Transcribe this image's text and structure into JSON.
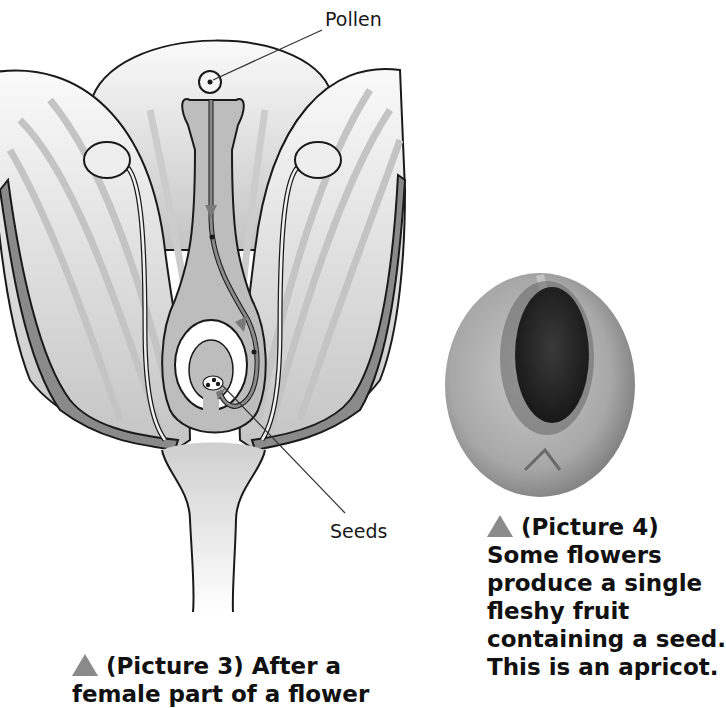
{
  "figure_left": {
    "id_label": "Picture 3",
    "labels": {
      "pollen": "Pollen",
      "seeds": "Seeds"
    },
    "caption": {
      "line1": "(Picture 3) After a",
      "line2": "female part of a flower"
    }
  },
  "figure_right": {
    "id_label": "Picture 4",
    "subject": "apricot half with seed",
    "caption": {
      "line1": "(Picture 4)",
      "line2": "Some flowers",
      "line3": "produce a single",
      "line4": "fleshy fruit",
      "line5": "containing a seed.",
      "line6": "This is an apricot."
    }
  },
  "colors": {
    "outline": "#1a1a1a",
    "petal_light": "#f2f2f2",
    "petal_stripe": "#c8c8c8",
    "petal_rim": "#8a8a8a",
    "ovary_fill": "#bdbdbd",
    "caption_triangle": "#8a8a8a",
    "apricot_flesh": "#b0b0b0",
    "apricot_pit": "#2a2a2a"
  }
}
